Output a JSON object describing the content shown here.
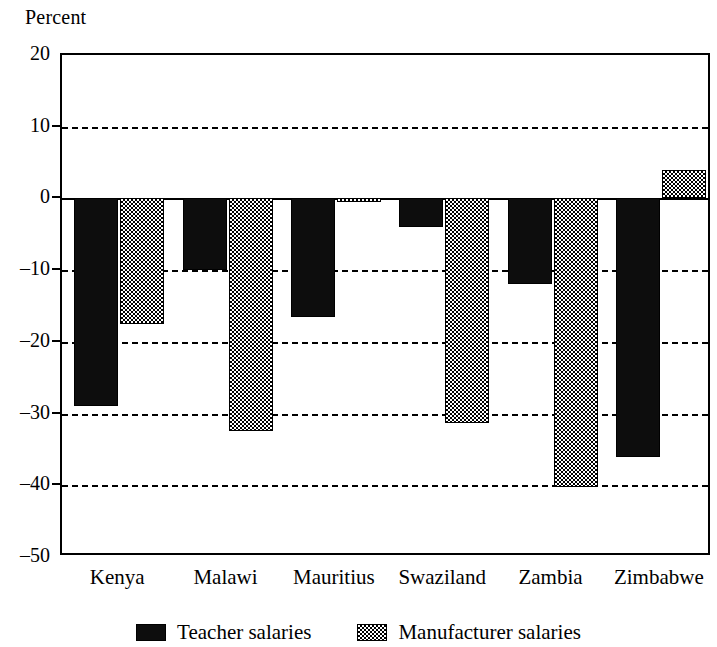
{
  "chart_data": {
    "type": "bar",
    "title": "",
    "xlabel": "",
    "ylabel": "Percent",
    "ylim": [
      -50,
      20
    ],
    "yticks": [
      20,
      10,
      0,
      -10,
      -20,
      -30,
      -40,
      -50
    ],
    "ytick_labels": [
      "20",
      "10",
      "0",
      "–10",
      "–20",
      "–30",
      "–40",
      "–50"
    ],
    "grid": true,
    "gridlines_at": [
      10,
      -10,
      -20,
      -30,
      -40
    ],
    "legend_position": "bottom-center",
    "categories": [
      "Kenya",
      "Malawi",
      "Mauritius",
      "Swaziland",
      "Zambia",
      "Zimbabwe"
    ],
    "series": [
      {
        "name": "Teacher salaries",
        "color": "#0d0d0d",
        "pattern": "solid-black",
        "values": [
          -29,
          -10,
          -16.5,
          -4,
          -12,
          -36
        ]
      },
      {
        "name": "Manufacturer salaries",
        "color": "#808080",
        "pattern": "checkerboard-gray",
        "values": [
          -17.5,
          -32.5,
          -0.5,
          -31.3,
          -40.2,
          4
        ]
      }
    ]
  },
  "axis": {
    "y_title": "Percent"
  },
  "legend": {
    "items": [
      {
        "label": "Teacher salaries",
        "swatch": "solid-black-swatch"
      },
      {
        "label": "Manufacturer salaries",
        "swatch": "checkered-gray-swatch"
      }
    ]
  }
}
